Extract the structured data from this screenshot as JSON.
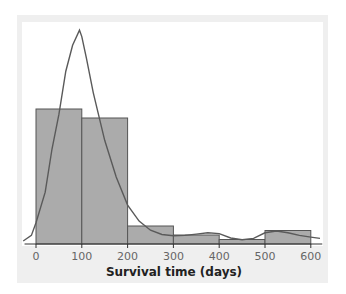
{
  "chart_data": {
    "type": "bar",
    "subtype": "histogram_with_density_curve",
    "title": "",
    "xlabel": "Survival time (days)",
    "ylabel": "",
    "x_ticks": [
      0,
      100,
      200,
      300,
      400,
      500,
      600
    ],
    "xlim": [
      -25,
      625
    ],
    "bins": [
      {
        "range": [
          0,
          100
        ],
        "count": 30
      },
      {
        "range": [
          100,
          200
        ],
        "count": 28
      },
      {
        "range": [
          200,
          300
        ],
        "count": 4
      },
      {
        "range": [
          300,
          400
        ],
        "count": 2
      },
      {
        "range": [
          400,
          500
        ],
        "count": 1
      },
      {
        "range": [
          500,
          600
        ],
        "count": 3
      }
    ],
    "categories": [
      "0-100",
      "100-200",
      "200-300",
      "300-400",
      "400-500",
      "500-600"
    ],
    "values": [
      30,
      28,
      4,
      2,
      1,
      3
    ],
    "density_curve": {
      "x": [
        -28,
        -10,
        0,
        20,
        35,
        50,
        65,
        80,
        95,
        100,
        110,
        125,
        150,
        175,
        200,
        225,
        250,
        275,
        300,
        325,
        350,
        375,
        400,
        425,
        450,
        475,
        500,
        525,
        550,
        575,
        600,
        620
      ],
      "y": [
        0.7,
        2,
        4.9,
        12,
        22,
        30,
        40,
        46,
        49.5,
        48,
        43,
        35,
        24,
        15.5,
        9,
        5.3,
        3.2,
        2.2,
        1.9,
        2,
        2.3,
        2.6,
        2.4,
        1.4,
        1.0,
        1.3,
        2.6,
        3.0,
        2.6,
        2.0,
        1.6,
        1.3
      ]
    },
    "grid": false,
    "legend": null,
    "colors": {
      "bar_fill": "#ababab",
      "bar_stroke": "#555555",
      "curve": "#5a5a5a",
      "frame": "#efefef"
    }
  }
}
